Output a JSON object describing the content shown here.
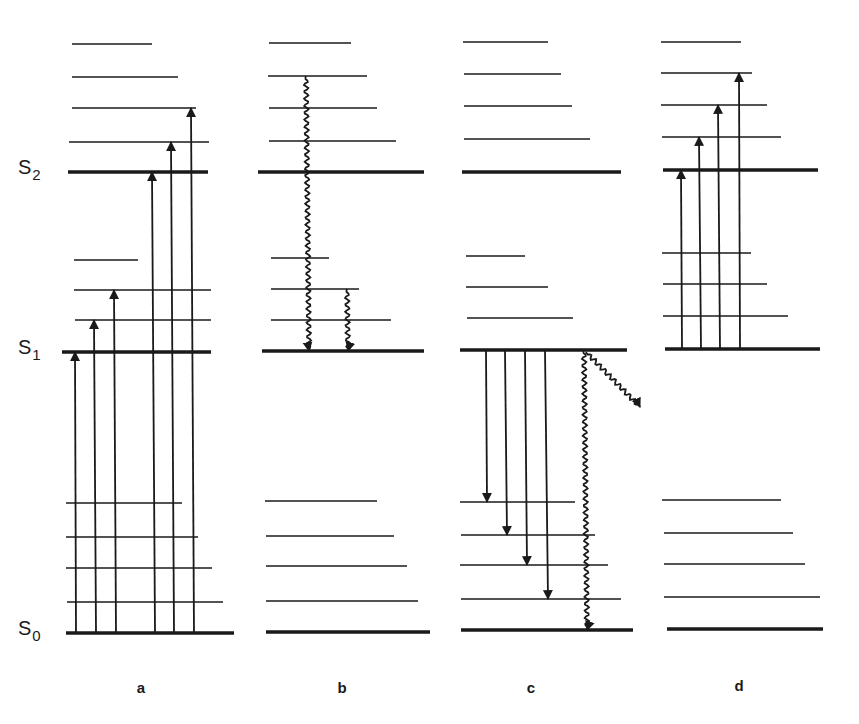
{
  "figure": {
    "type": "jablonski-energy-level-diagram",
    "colors": {
      "line": "#1a1a1a",
      "background": "#ffffff"
    },
    "state_labels": [
      {
        "id": "S2",
        "letter": "S",
        "sub": "2",
        "x": 28,
        "y": 172
      },
      {
        "id": "S1",
        "letter": "S",
        "sub": "1",
        "x": 28,
        "y": 352
      },
      {
        "id": "S0",
        "letter": "S",
        "sub": "0",
        "x": 28,
        "y": 633
      }
    ],
    "panels": [
      {
        "id": "a",
        "label": "a",
        "label_x": 141,
        "label_y": 693,
        "electronic_levels": [
          {
            "name": "S2",
            "y": 172,
            "x1": 68,
            "x2": 208
          },
          {
            "name": "S1",
            "y": 352,
            "x1": 62,
            "x2": 211
          },
          {
            "name": "S0",
            "y": 633,
            "x1": 66,
            "x2": 234
          }
        ],
        "vibrational_levels": [
          {
            "y": 44,
            "x1": 72,
            "x2": 152
          },
          {
            "y": 77,
            "x1": 72,
            "x2": 178
          },
          {
            "y": 108,
            "x1": 72,
            "x2": 196
          },
          {
            "y": 142,
            "x1": 69,
            "x2": 209
          },
          {
            "y": 260,
            "x1": 74,
            "x2": 138
          },
          {
            "y": 290,
            "x1": 74,
            "x2": 211
          },
          {
            "y": 320,
            "x1": 75,
            "x2": 211
          },
          {
            "y": 503,
            "x1": 66,
            "x2": 182
          },
          {
            "y": 537,
            "x1": 66,
            "x2": 198
          },
          {
            "y": 568,
            "x1": 66,
            "x2": 212
          },
          {
            "y": 602,
            "x1": 67,
            "x2": 223
          }
        ],
        "transitions": [
          {
            "kind": "absorption",
            "style": "straight",
            "direction": "up",
            "x1": 76,
            "y1": 633,
            "x2": 75,
            "y2": 352
          },
          {
            "kind": "absorption",
            "style": "straight",
            "direction": "up",
            "x1": 96,
            "y1": 633,
            "x2": 94,
            "y2": 320
          },
          {
            "kind": "absorption",
            "style": "straight",
            "direction": "up",
            "x1": 116,
            "y1": 633,
            "x2": 114,
            "y2": 290
          },
          {
            "kind": "absorption",
            "style": "straight",
            "direction": "up",
            "x1": 155,
            "y1": 633,
            "x2": 152,
            "y2": 172
          },
          {
            "kind": "absorption",
            "style": "straight",
            "direction": "up",
            "x1": 174,
            "y1": 633,
            "x2": 171,
            "y2": 142
          },
          {
            "kind": "absorption",
            "style": "straight",
            "direction": "up",
            "x1": 194,
            "y1": 633,
            "x2": 191,
            "y2": 108
          }
        ]
      },
      {
        "id": "b",
        "label": "b",
        "label_x": 342,
        "label_y": 693,
        "electronic_levels": [
          {
            "name": "S2",
            "y": 172,
            "x1": 258,
            "x2": 424
          },
          {
            "name": "S1",
            "y": 351,
            "x1": 262,
            "x2": 424
          },
          {
            "name": "S0",
            "y": 632,
            "x1": 266,
            "x2": 430
          }
        ],
        "vibrational_levels": [
          {
            "y": 43,
            "x1": 269,
            "x2": 351
          },
          {
            "y": 76,
            "x1": 268,
            "x2": 367
          },
          {
            "y": 108,
            "x1": 269,
            "x2": 377
          },
          {
            "y": 141,
            "x1": 269,
            "x2": 396
          },
          {
            "y": 258,
            "x1": 271,
            "x2": 329
          },
          {
            "y": 289,
            "x1": 271,
            "x2": 359
          },
          {
            "y": 320,
            "x1": 271,
            "x2": 391
          },
          {
            "y": 501,
            "x1": 265,
            "x2": 377
          },
          {
            "y": 536,
            "x1": 266,
            "x2": 394
          },
          {
            "y": 566,
            "x1": 266,
            "x2": 407
          },
          {
            "y": 601,
            "x1": 266,
            "x2": 418
          }
        ],
        "transitions": [
          {
            "kind": "internal-conversion / vibrational-relaxation",
            "style": "wavy",
            "direction": "down",
            "x1": 306,
            "y1": 76,
            "x2": 309,
            "y2": 351
          },
          {
            "kind": "vibrational-relaxation",
            "style": "wavy",
            "direction": "down",
            "x1": 347,
            "y1": 289,
            "x2": 348,
            "y2": 351
          }
        ]
      },
      {
        "id": "c",
        "label": "c",
        "label_x": 531,
        "label_y": 693,
        "electronic_levels": [
          {
            "name": "S2",
            "y": 172,
            "x1": 462,
            "x2": 621
          },
          {
            "name": "S1",
            "y": 350,
            "x1": 460,
            "x2": 627
          },
          {
            "name": "S0",
            "y": 630,
            "x1": 461,
            "x2": 633
          }
        ],
        "vibrational_levels": [
          {
            "y": 42,
            "x1": 463,
            "x2": 548
          },
          {
            "y": 74,
            "x1": 464,
            "x2": 561
          },
          {
            "y": 106,
            "x1": 464,
            "x2": 572
          },
          {
            "y": 139,
            "x1": 464,
            "x2": 590
          },
          {
            "y": 256,
            "x1": 466,
            "x2": 525
          },
          {
            "y": 287,
            "x1": 466,
            "x2": 548
          },
          {
            "y": 318,
            "x1": 467,
            "x2": 573
          },
          {
            "y": 502,
            "x1": 460,
            "x2": 575
          },
          {
            "y": 535,
            "x1": 461,
            "x2": 595
          },
          {
            "y": 565,
            "x1": 460,
            "x2": 608
          },
          {
            "y": 599,
            "x1": 461,
            "x2": 621
          }
        ],
        "transitions": [
          {
            "kind": "fluorescence",
            "style": "straight",
            "direction": "down",
            "x1": 486,
            "y1": 350,
            "x2": 487,
            "y2": 502
          },
          {
            "kind": "fluorescence",
            "style": "straight",
            "direction": "down",
            "x1": 505,
            "y1": 350,
            "x2": 507,
            "y2": 535
          },
          {
            "kind": "fluorescence",
            "style": "straight",
            "direction": "down",
            "x1": 525,
            "y1": 350,
            "x2": 527,
            "y2": 565
          },
          {
            "kind": "fluorescence",
            "style": "straight",
            "direction": "down",
            "x1": 545,
            "y1": 350,
            "x2": 548,
            "y2": 599
          },
          {
            "kind": "internal-conversion",
            "style": "wavy",
            "direction": "down",
            "x1": 584,
            "y1": 350,
            "x2": 587,
            "y2": 630
          },
          {
            "kind": "intersystem-crossing",
            "style": "wavy",
            "direction": "diagonal",
            "x1": 586,
            "y1": 352,
            "x2": 640,
            "y2": 407
          }
        ]
      },
      {
        "id": "d",
        "label": "d",
        "label_x": 739,
        "label_y": 691,
        "electronic_levels": [
          {
            "name": "S2",
            "y": 170,
            "x1": 663,
            "x2": 818
          },
          {
            "name": "S1",
            "y": 349,
            "x1": 665,
            "x2": 820
          },
          {
            "name": "S0",
            "y": 629,
            "x1": 667,
            "x2": 823
          }
        ],
        "vibrational_levels": [
          {
            "y": 42,
            "x1": 661,
            "x2": 741
          },
          {
            "y": 73,
            "x1": 661,
            "x2": 752
          },
          {
            "y": 105,
            "x1": 661,
            "x2": 767
          },
          {
            "y": 137,
            "x1": 662,
            "x2": 781
          },
          {
            "y": 253,
            "x1": 662,
            "x2": 751
          },
          {
            "y": 284,
            "x1": 663,
            "x2": 767
          },
          {
            "y": 316,
            "x1": 663,
            "x2": 788
          },
          {
            "y": 500,
            "x1": 662,
            "x2": 781
          },
          {
            "y": 533,
            "x1": 664,
            "x2": 793
          },
          {
            "y": 564,
            "x1": 664,
            "x2": 805
          },
          {
            "y": 597,
            "x1": 664,
            "x2": 820
          }
        ],
        "transitions": [
          {
            "kind": "excited-state-absorption",
            "style": "straight",
            "direction": "up",
            "x1": 682,
            "y1": 349,
            "x2": 681,
            "y2": 170
          },
          {
            "kind": "excited-state-absorption",
            "style": "straight",
            "direction": "up",
            "x1": 701,
            "y1": 349,
            "x2": 699,
            "y2": 137
          },
          {
            "kind": "excited-state-absorption",
            "style": "straight",
            "direction": "up",
            "x1": 720,
            "y1": 349,
            "x2": 718,
            "y2": 105
          },
          {
            "kind": "excited-state-absorption",
            "style": "straight",
            "direction": "up",
            "x1": 740,
            "y1": 349,
            "x2": 739,
            "y2": 73
          }
        ]
      }
    ]
  }
}
